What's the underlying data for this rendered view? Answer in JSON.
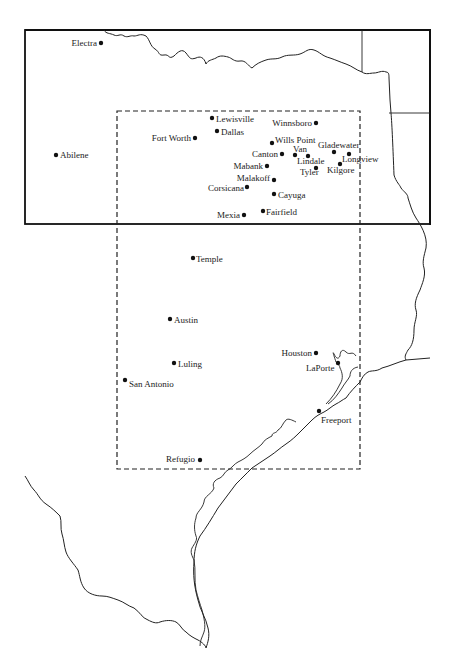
{
  "map": {
    "type": "locator map",
    "frame": {
      "x": 25,
      "y": 30,
      "width": 405,
      "height": 195
    },
    "study_area": {
      "x": 117,
      "y": 111,
      "width": 243,
      "height": 358,
      "style": "dashed"
    },
    "cities": [
      {
        "name": "Electra",
        "x": 101,
        "y": 43,
        "label_side": "left"
      },
      {
        "name": "Abilene",
        "x": 56,
        "y": 155,
        "label_side": "right"
      },
      {
        "name": "Lewisville",
        "x": 212,
        "y": 118,
        "label_side": "right"
      },
      {
        "name": "Dallas",
        "x": 217,
        "y": 131,
        "label_side": "right"
      },
      {
        "name": "Fort Worth",
        "x": 195,
        "y": 138,
        "label_side": "left"
      },
      {
        "name": "Winnsboro",
        "x": 316,
        "y": 123,
        "label_side": "left"
      },
      {
        "name": "Wills Point",
        "x": 272,
        "y": 142,
        "label_side": "right"
      },
      {
        "name": "Gladewater",
        "x": 334,
        "y": 152,
        "label_side": "above"
      },
      {
        "name": "Van",
        "x": 295,
        "y": 155,
        "label_side": "above"
      },
      {
        "name": "Canton",
        "x": 282,
        "y": 154,
        "label_side": "left"
      },
      {
        "name": "Lindale",
        "x": 308,
        "y": 155,
        "label_side": "below"
      },
      {
        "name": "Longview",
        "x": 349,
        "y": 154,
        "label_side": "below"
      },
      {
        "name": "Kilgore",
        "x": 340,
        "y": 164,
        "label_side": "below"
      },
      {
        "name": "Tyler",
        "x": 316,
        "y": 168,
        "label_side": "below"
      },
      {
        "name": "Mabank",
        "x": 267,
        "y": 166,
        "label_side": "left"
      },
      {
        "name": "Malakoff",
        "x": 274,
        "y": 180,
        "label_side": "left"
      },
      {
        "name": "Corsicana",
        "x": 247,
        "y": 187,
        "label_side": "left"
      },
      {
        "name": "Cayuga",
        "x": 274,
        "y": 194,
        "label_side": "right"
      },
      {
        "name": "Mexia",
        "x": 244,
        "y": 215,
        "label_side": "left"
      },
      {
        "name": "Fairfield",
        "x": 263,
        "y": 211,
        "label_side": "right"
      },
      {
        "name": "Temple",
        "x": 193,
        "y": 258,
        "label_side": "right"
      },
      {
        "name": "Austin",
        "x": 170,
        "y": 319,
        "label_side": "right"
      },
      {
        "name": "Houston",
        "x": 316,
        "y": 353,
        "label_side": "left"
      },
      {
        "name": "LaPorte",
        "x": 338,
        "y": 363,
        "label_side": "below-left"
      },
      {
        "name": "Luling",
        "x": 174,
        "y": 363,
        "label_side": "right"
      },
      {
        "name": "San Antonio",
        "x": 125,
        "y": 380,
        "label_side": "right"
      },
      {
        "name": "Freeport",
        "x": 319,
        "y": 411,
        "label_side": "below"
      },
      {
        "name": "Refugio",
        "x": 200,
        "y": 460,
        "label_side": "left"
      }
    ]
  }
}
